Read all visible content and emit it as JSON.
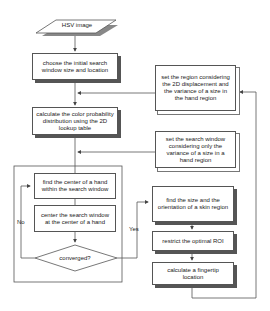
{
  "diagram": {
    "type": "flowchart",
    "nodes": {
      "input": "HSV image",
      "init": "choose the initial search window size and location",
      "calc_prob": "calculate the color probability distribution using the 2D lookup table",
      "find_center": "find the center of a hand within the search window",
      "center_window": "center the search window at the center of a hand",
      "converged": "converged?",
      "set_region": "set the region considering the 2D displacement and the variance of a size in the hand region",
      "set_window": "set the search window considering only the variance of a size in a hand region",
      "find_size": "find the size and the orientation of a skin region",
      "restrict_roi": "restrict the optimal ROI",
      "fingertip": "calculate a fingertip location"
    },
    "edge_labels": {
      "no": "No",
      "yes": "Yes"
    },
    "colors": {
      "line": "#555555",
      "shadow": "#555555",
      "background": "#ffffff"
    }
  }
}
